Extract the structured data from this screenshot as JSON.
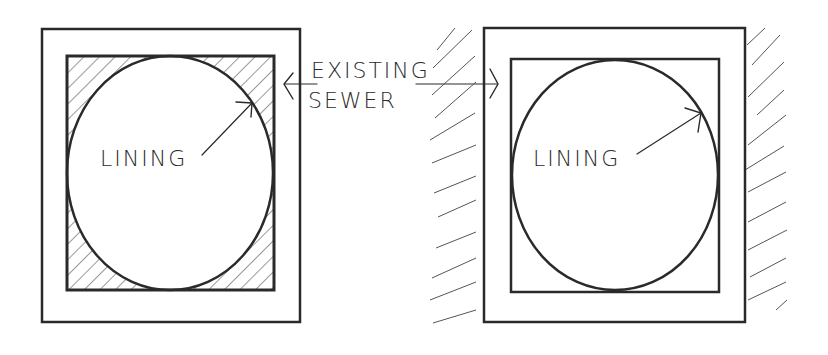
{
  "diagram": {
    "title": "",
    "left_figure": {
      "label": "LINING",
      "description": "Circular lining inside square existing sewer, annular space filled (hatched)"
    },
    "right_figure": {
      "label": "LINING",
      "description": "Circular lining inside square existing sewer, annular space unfilled; surrounding soil hatched"
    },
    "shared_annotation": {
      "line1": "EXISTING",
      "line2": "SEWER"
    },
    "colors": {
      "ink": "#2a2a2a",
      "background": "#ffffff"
    }
  }
}
